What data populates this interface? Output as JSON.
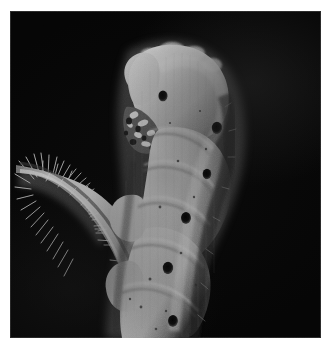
{
  "image": {
    "domain": "Natural-Image",
    "subject": "pale caterpillar (larva) clinging to a hairy plant stem",
    "caption": "",
    "background_color": "#050505",
    "paper_color": "#ffffff",
    "body_color": "#c3c3c3",
    "body_shadow_color": "#5a5a5a",
    "stem_color": "#bdbdbd",
    "spiracle_color": "#101010",
    "frame": {
      "left": 10,
      "top": 11,
      "width": 311,
      "height": 327
    },
    "canvas": {
      "width": 331,
      "height": 352
    }
  },
  "chart_data": null,
  "subject_parts": {
    "head": "rounded pale head capsule at upper area with dark ocellus",
    "mouthparts": "dark mottled mandibles and maxillary palps on left of head",
    "body": "segmented pale abdomen curving down and left",
    "spiracles": "row of dark oval spiracles along each segment",
    "prolegs": "pale prolegs gripping the stem near the lower left",
    "stem": "hairy plant stem entering from the left edge, covered in fine trichomes"
  },
  "spiracle_points": [
    {
      "x": 153,
      "y": 85,
      "rx": 4.6,
      "ry": 5.6,
      "label": "ocellus"
    },
    {
      "x": 207,
      "y": 117,
      "rx": 5.2,
      "ry": 6.2,
      "label": "spiracle-1"
    },
    {
      "x": 197,
      "y": 163,
      "rx": 4.4,
      "ry": 5.2,
      "label": "spiracle-2"
    },
    {
      "x": 176,
      "y": 207,
      "rx": 5.0,
      "ry": 6.0,
      "label": "spiracle-3"
    },
    {
      "x": 158,
      "y": 257,
      "rx": 5.2,
      "ry": 6.2,
      "label": "spiracle-4"
    },
    {
      "x": 163,
      "y": 310,
      "rx": 5.0,
      "ry": 6.0,
      "label": "spiracle-5"
    }
  ],
  "meta": {
    "tone": "high-contrast monochrome macro photograph",
    "lighting": "strong key light from upper left, deep black background"
  }
}
